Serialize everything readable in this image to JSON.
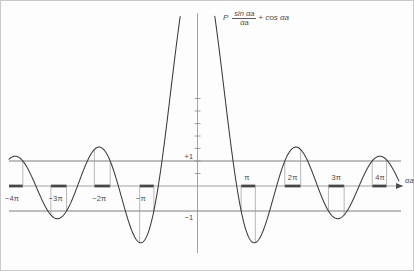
{
  "figure": {
    "title_formula": {
      "lhs": "P",
      "numerator": "sin αa",
      "denominator": "αa",
      "operator": "+",
      "rhs": "cos αa"
    },
    "axis": {
      "x_axis_label": "αa",
      "y_plus_one": "+1",
      "y_minus_one": "−1"
    },
    "x_ticks": [
      {
        "label": "−4π",
        "value": -12.566
      },
      {
        "label": "−3π",
        "value": -9.4248
      },
      {
        "label": "−2π",
        "value": -6.2832
      },
      {
        "label": "−π",
        "value": -3.1416
      },
      {
        "label": "π",
        "value": 3.1416
      },
      {
        "label": "2π",
        "value": 6.2832
      },
      {
        "label": "3π",
        "value": 9.4248
      },
      {
        "label": "4π",
        "value": 12.566
      }
    ]
  },
  "chart_data": {
    "type": "line",
    "xlabel": "αa",
    "ylabel": "",
    "xlim": [
      -14.5,
      14.5
    ],
    "ylim": [
      -2.05,
      4.4
    ],
    "grid": false,
    "legend": null,
    "P": 8.5,
    "function": "P*sin(x)/x + cos(x)",
    "reference_lines": [
      {
        "y": 1,
        "label": "+1"
      },
      {
        "y": -1,
        "label": "−1"
      }
    ],
    "allowed_bands": [
      [
        -13.6,
        -12.57
      ],
      [
        -10.55,
        -9.42
      ],
      [
        -7.42,
        -6.28
      ],
      [
        -4.16,
        -3.14
      ],
      [
        3.14,
        4.16
      ],
      [
        6.28,
        7.42
      ],
      [
        9.42,
        10.55
      ],
      [
        12.57,
        13.6
      ]
    ],
    "annotations": [
      {
        "text": "+1",
        "x": -0.55,
        "y": 1
      },
      {
        "text": "−1",
        "x": -0.55,
        "y": -1
      }
    ]
  }
}
